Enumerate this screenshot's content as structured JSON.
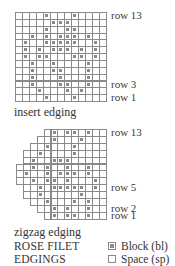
{
  "insert_chart": {
    "caption": "insert edging",
    "labels": [
      {
        "text": "row 13",
        "row": 0
      },
      {
        "text": "row 3",
        "row": 10
      },
      {
        "text": "row 1",
        "row": 12
      }
    ],
    "cols": 13,
    "rows": [
      {
        "start": 0,
        "filled": [
          4,
          8
        ]
      },
      {
        "start": 0,
        "filled": [
          5,
          6,
          7
        ]
      },
      {
        "start": 0,
        "filled": [
          4,
          7,
          8
        ]
      },
      {
        "start": 0,
        "filled": [
          2,
          4,
          6,
          7,
          8,
          10
        ]
      },
      {
        "start": 0,
        "filled": [
          1,
          4,
          5,
          6,
          7,
          8,
          11
        ]
      },
      {
        "start": 0,
        "filled": [
          1,
          3,
          5,
          6,
          7,
          9,
          11
        ]
      },
      {
        "start": 0,
        "filled": [
          1,
          3,
          4,
          8,
          9,
          11
        ]
      },
      {
        "start": 0,
        "filled": [
          2,
          5,
          10
        ]
      },
      {
        "start": 0,
        "filled": [
          2,
          5,
          6,
          10
        ]
      },
      {
        "start": 0,
        "filled": [
          2,
          6,
          10
        ]
      },
      {
        "start": 0,
        "filled": [
          2,
          6,
          7,
          10
        ]
      },
      {
        "start": 0,
        "filled": [
          3,
          7,
          9
        ]
      },
      {
        "start": 0,
        "filled": [
          4,
          8
        ]
      }
    ]
  },
  "zigzag_chart": {
    "caption": "zigzag edging",
    "labels": [
      {
        "text": "row 13",
        "row": 0
      },
      {
        "text": "row 5",
        "row": 8
      },
      {
        "text": "row 2",
        "row": 11
      },
      {
        "text": "row 1",
        "row": 12
      }
    ],
    "cols": 13,
    "rows": [
      {
        "start": 4,
        "end": 12,
        "filled": [
          5,
          7,
          8,
          10
        ]
      },
      {
        "start": 3,
        "end": 12,
        "filled": [
          5,
          9
        ]
      },
      {
        "start": 2,
        "end": 12,
        "filled": [
          4,
          8
        ]
      },
      {
        "start": 1,
        "end": 12,
        "filled": [
          3,
          8
        ]
      },
      {
        "start": 1,
        "end": 12,
        "filled": [
          2,
          5,
          6,
          7
        ]
      },
      {
        "start": 0,
        "end": 12,
        "filled": [
          2,
          4,
          7,
          10
        ]
      },
      {
        "start": 0,
        "end": 12,
        "filled": [
          1,
          4,
          6,
          7,
          8,
          10
        ]
      },
      {
        "start": 0,
        "end": 12,
        "filled": [
          2,
          4,
          5,
          7,
          11
        ]
      },
      {
        "start": 1,
        "end": 12,
        "filled": [
          3,
          5,
          6,
          7,
          8,
          9,
          11
        ]
      },
      {
        "start": 1,
        "end": 12,
        "filled": [
          3,
          9
        ]
      },
      {
        "start": 2,
        "end": 12,
        "filled": [
          4,
          8,
          10
        ]
      },
      {
        "start": 3,
        "end": 12,
        "filled": [
          5,
          7,
          10
        ]
      },
      {
        "start": 4,
        "end": 12,
        "filled": [
          5,
          7,
          8,
          10
        ]
      }
    ]
  },
  "title": {
    "line1": "ROSE FILET",
    "line2": "EDGINGS"
  },
  "legend": {
    "block_label": "Block (bl)",
    "space_label": "Space (sp)"
  },
  "colors": {
    "grid_line": "#8a8a8a",
    "block_fill": "#8a8a8a",
    "text": "#333333"
  }
}
